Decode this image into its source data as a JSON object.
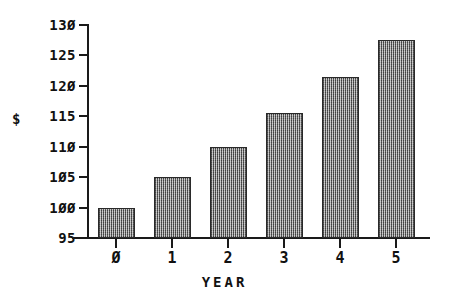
{
  "chart_data": {
    "type": "bar",
    "title": "",
    "xlabel": "YEAR",
    "ylabel": "$",
    "categories": [
      "0",
      "1",
      "2",
      "3",
      "4",
      "5"
    ],
    "values": [
      100,
      105,
      110,
      115.5,
      121.5,
      127.5
    ],
    "ylim": [
      95,
      130
    ],
    "ytick_values": [
      95,
      100,
      105,
      110,
      115,
      120,
      125,
      130
    ],
    "ytick_labels": [
      "95",
      "100",
      "105",
      "110",
      "115",
      "120",
      "125",
      "130"
    ],
    "grid": false,
    "legend": null,
    "series": [
      {
        "name": "",
        "values": [
          100,
          105,
          110,
          115.5,
          121.5,
          127.5
        ]
      }
    ],
    "bar_color": "#8a8a8a",
    "bar_edge_color": "#2a2a2a",
    "axis_color": "#1a1a1a",
    "background_color": "#ffffff"
  }
}
